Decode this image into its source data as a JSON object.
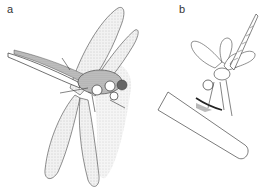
{
  "figure": {
    "panels": [
      {
        "label": "a",
        "subject": "dragonfly with wings spread, dorsal oblique view"
      },
      {
        "label": "b",
        "subject": "dragonfly perched on stick, obelisk posture with abdomen raised"
      }
    ]
  },
  "colors": {
    "line": "#333333",
    "wing_fill": "#e6e6e6",
    "shade": "#8a8a8a",
    "dark": "#3a3a3a"
  }
}
